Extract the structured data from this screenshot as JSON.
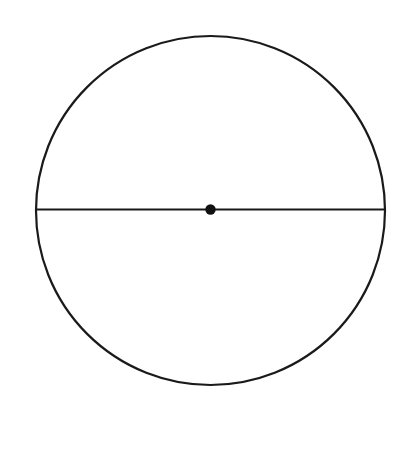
{
  "canvas": {
    "width": 396,
    "height": 463,
    "background_color": "#ffffff"
  },
  "figure": {
    "name": "circle-with-diameter",
    "stroke_color": "#1a1a1a",
    "fill_color": "none",
    "dot_color": "#111111"
  },
  "shapes": {
    "circle": {
      "label": "circle-outline",
      "center_x": 210.5,
      "center_y": 210.5,
      "radius": 174.5,
      "stroke_width": 2.2,
      "fill": "none",
      "stroke": "#1a1a1a"
    },
    "diameter_line": {
      "label": "horizontal-diameter",
      "x1": 36,
      "y1": 209.5,
      "x2": 385,
      "y2": 209.5,
      "stroke_width": 2.2,
      "stroke": "#1a1a1a",
      "length": 349
    },
    "center_dot": {
      "label": "center-point-marker",
      "cx": 210.5,
      "cy": 209.5,
      "radius": 5.2,
      "fill": "#111111"
    }
  },
  "labels": {
    "title": "",
    "annotations": []
  }
}
